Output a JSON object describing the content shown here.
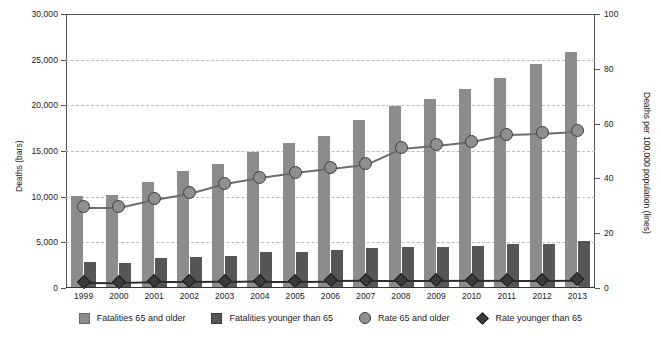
{
  "chart_data": {
    "type": "bar",
    "title": "",
    "subtitle": "",
    "xlabel": "",
    "ylabel": "Deaths (bars)",
    "y2label": "Deaths per 100,000 population (lines)",
    "categories": [
      "1999",
      "2000",
      "2001",
      "2002",
      "2003",
      "2004",
      "2005",
      "2006",
      "2007",
      "2008",
      "2009",
      "2010",
      "2011",
      "2012",
      "2013"
    ],
    "ylim": [
      0,
      30000
    ],
    "y2lim": [
      0,
      100
    ],
    "yticks": [
      "0",
      "5,000",
      "10,000",
      "15,000",
      "20,000",
      "25,000",
      "30,000"
    ],
    "ytick_values": [
      0,
      5000,
      10000,
      15000,
      20000,
      25000,
      30000
    ],
    "y2ticks": [
      "0",
      "20",
      "40",
      "60",
      "80",
      "100"
    ],
    "y2tick_values": [
      0,
      20,
      40,
      60,
      80,
      100
    ],
    "grid": true,
    "legend_position": "bottom",
    "series": [
      {
        "name": "Fatalities 65 and older",
        "type": "bar",
        "axis": "left",
        "color": "#8c8c8c",
        "values": [
          10100,
          10200,
          11600,
          12800,
          13600,
          14900,
          15900,
          16600,
          18400,
          19900,
          20700,
          21800,
          23000,
          24500,
          25800
        ]
      },
      {
        "name": "Fatalities younger than 65",
        "type": "bar",
        "axis": "left",
        "color": "#565656",
        "values": [
          2850,
          2750,
          3300,
          3350,
          3500,
          3900,
          3950,
          4150,
          4400,
          4450,
          4500,
          4600,
          4800,
          4850,
          5100
        ]
      },
      {
        "name": "Rate 65 and older",
        "type": "line",
        "axis": "right",
        "color": "#6d6d6d",
        "marker": "circle",
        "values": [
          29.6,
          29.6,
          32.5,
          34.7,
          38.3,
          40.5,
          42.3,
          43.8,
          45.3,
          51.1,
          52.2,
          53.6,
          56.2,
          56.6,
          57.3
        ]
      },
      {
        "name": "Rate younger than 65",
        "type": "line",
        "axis": "right",
        "color": "#2f2f2f",
        "marker": "diamond",
        "values": [
          2.2,
          2.1,
          2.4,
          2.4,
          2.5,
          2.7,
          2.7,
          2.8,
          2.9,
          2.9,
          2.9,
          3.0,
          3.1,
          3.1,
          3.2
        ]
      }
    ]
  },
  "legend": {
    "items": [
      {
        "label": "Fatalities 65 and older",
        "glyph": "square-light-gray-icon"
      },
      {
        "label": "Fatalities younger than 65",
        "glyph": "square-dark-gray-icon"
      },
      {
        "label": "Rate 65 and older",
        "glyph": "circle-gray-icon"
      },
      {
        "label": "Rate younger than 65",
        "glyph": "diamond-dark-icon"
      }
    ]
  }
}
